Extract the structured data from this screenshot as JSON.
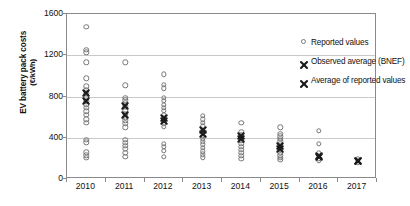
{
  "chart_data": {
    "type": "scatter",
    "title": "",
    "xlabel": "",
    "ylabel": "EV battery pack costs",
    "ylabel_units": "(€/kWh)",
    "ylim": [
      0,
      1600
    ],
    "yticks": [
      0,
      400,
      800,
      1200,
      1600
    ],
    "grid": true,
    "categories": [
      "2010",
      "2011",
      "2012",
      "2013",
      "2014",
      "2015",
      "2016",
      "2017"
    ],
    "legend_position": "top-right",
    "legend": [
      {
        "label": "Reported values",
        "marker": "open-circle"
      },
      {
        "label": "Observed average (BNEF)",
        "marker": "x"
      },
      {
        "label": "Average of reported values",
        "marker": "x"
      }
    ],
    "series": [
      {
        "name": "Reported values",
        "marker": "open-circle",
        "points": [
          {
            "x": "2010",
            "values": [
              1475,
              1255,
              1230,
              1130,
              975,
              900,
              860,
              830,
              790,
              755,
              720,
              690,
              655,
              620,
              580,
              545,
              380,
              355,
              260,
              230,
              205
            ]
          },
          {
            "x": "2011",
            "values": [
              1130,
              910,
              790,
              765,
              740,
              705,
              660,
              630,
              600,
              570,
              540,
              500,
              380,
              350,
              320,
              290,
              255,
              215
            ]
          },
          {
            "x": "2012",
            "values": [
              1015,
              915,
              880,
              790,
              760,
              720,
              690,
              660,
              625,
              595,
              565,
              540,
              505,
              340,
              310,
              275,
              215
            ]
          },
          {
            "x": "2013",
            "values": [
              615,
              580,
              545,
              510,
              480,
              450,
              420,
              395,
              365,
              335,
              300,
              270,
              240,
              210
            ]
          },
          {
            "x": "2014",
            "values": [
              545,
              460,
              430,
              400,
              370,
              340,
              310,
              285,
              255,
              225,
              195
            ]
          },
          {
            "x": "2015",
            "values": [
              500,
              440,
              415,
              390,
              365,
              340,
              310,
              285,
              255,
              230,
              205,
              185
            ]
          },
          {
            "x": "2016",
            "values": [
              470,
              340,
              250,
              225,
              200,
              180
            ]
          },
          {
            "x": "2017",
            "values": [
              195,
              175,
              160
            ]
          }
        ]
      },
      {
        "name": "Observed average (BNEF)",
        "marker": "x",
        "values": [
          830,
          705,
          595,
          475,
          420,
          320,
          220,
          175
        ]
      },
      {
        "name": "Average of reported values",
        "marker": "x",
        "values": [
          755,
          620,
          560,
          440,
          385,
          295,
          215,
          175
        ]
      }
    ]
  },
  "colors": {
    "marker_outline": "#777777",
    "x_marker": "#1a1a1a",
    "gridline": "#c9c9c9",
    "frame": "#8a8a8a",
    "background": "#ffffff"
  }
}
